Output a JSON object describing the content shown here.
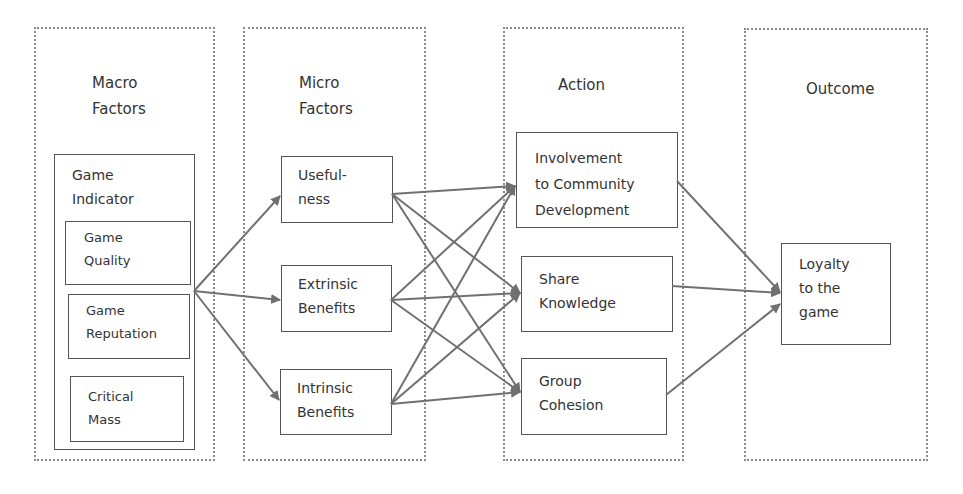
{
  "diagram": {
    "groups": [
      {
        "id": "macro",
        "title": "Macro\nFactors"
      },
      {
        "id": "micro",
        "title": "Micro\nFactors"
      },
      {
        "id": "action",
        "title": "Action"
      },
      {
        "id": "outcome",
        "title": "Outcome"
      }
    ],
    "nodes": {
      "game_indicator": "Game\nIndicator",
      "game_quality": "Game\nQuality",
      "game_reputation": "Game\nReputation",
      "critical_mass": "Critical\nMass",
      "usefulness": "Useful-\nness",
      "extrinsic_benefits": "Extrinsic\nBenefits",
      "intrinsic_benefits": "Intrinsic\nBenefits",
      "involvement": "Involvement\nto Community\nDevelopment",
      "share_knowledge": "Share\nKnowledge",
      "group_cohesion": "Group\nCohesion",
      "loyalty": "Loyalty\nto the\ngame"
    },
    "edges": [
      [
        "game_indicator",
        "usefulness"
      ],
      [
        "game_indicator",
        "extrinsic_benefits"
      ],
      [
        "game_indicator",
        "intrinsic_benefits"
      ],
      [
        "usefulness",
        "involvement"
      ],
      [
        "usefulness",
        "share_knowledge"
      ],
      [
        "usefulness",
        "group_cohesion"
      ],
      [
        "extrinsic_benefits",
        "involvement"
      ],
      [
        "extrinsic_benefits",
        "share_knowledge"
      ],
      [
        "extrinsic_benefits",
        "group_cohesion"
      ],
      [
        "intrinsic_benefits",
        "involvement"
      ],
      [
        "intrinsic_benefits",
        "share_knowledge"
      ],
      [
        "intrinsic_benefits",
        "group_cohesion"
      ],
      [
        "involvement",
        "loyalty"
      ],
      [
        "share_knowledge",
        "loyalty"
      ],
      [
        "group_cohesion",
        "loyalty"
      ]
    ],
    "colors": {
      "line": "#707070",
      "box": "#555555",
      "dotted": "#8a8a8a"
    }
  }
}
